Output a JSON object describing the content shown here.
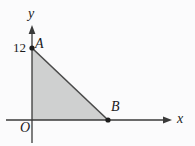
{
  "figure": {
    "background_color": "#fbfbfc",
    "axis_color": "#3a3a3a",
    "shape_fill_color": "#cfd0d0",
    "shape_stroke_color": "#4a4a4a",
    "point_color": "#1c1c1c"
  },
  "axes": {
    "x_axis_label": "x",
    "y_axis_label": "y",
    "origin_label": "O",
    "x_axis_y_pixel": 120,
    "y_axis_x_pixel": 32,
    "x_axis_start_px": 6,
    "x_axis_end_px": 172,
    "y_axis_top_px": 25,
    "y_axis_bottom_px": 143
  },
  "ticks": {
    "y": [
      {
        "label": "12",
        "value": 12,
        "pixel_y": 48
      }
    ],
    "x": []
  },
  "points": [
    {
      "name": "A",
      "label": "A",
      "x_px": 32,
      "y_px": 48,
      "coord_label": "12"
    },
    {
      "name": "B",
      "label": "B",
      "x_px": 108,
      "y_px": 120,
      "coord_label": ""
    }
  ],
  "shape": {
    "type": "triangle",
    "vertices_label": "O A B",
    "vertices_px": [
      {
        "x": 32,
        "y": 48
      },
      {
        "x": 32,
        "y": 120
      },
      {
        "x": 108,
        "y": 120
      }
    ],
    "shaded": true
  }
}
